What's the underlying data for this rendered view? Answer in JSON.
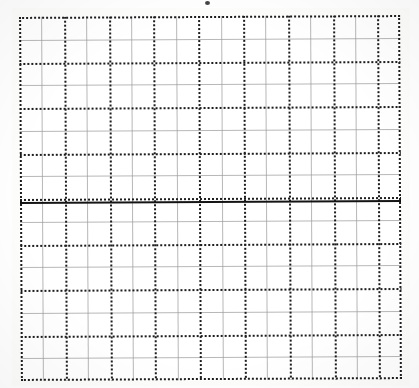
{
  "page": {
    "width": 419,
    "height": 388,
    "background_color": "#ffffff"
  },
  "artifact": {
    "name": "scan-speck",
    "label": ""
  },
  "chart_data": {
    "type": "table",
    "title": "",
    "subtitle": "",
    "xlabel": "",
    "ylabel": "",
    "annotations": [],
    "legend": [],
    "legend_position": "none",
    "grid": true,
    "plot_box": {
      "x": 20,
      "y": 16,
      "width": 381,
      "height": 364
    },
    "cell_size_px": 22.4,
    "columns": 17,
    "rows": 16,
    "xlim": [
      0,
      17
    ],
    "ylim": [
      0,
      16
    ],
    "x_ticks": [
      0,
      1,
      2,
      3,
      4,
      5,
      6,
      7,
      8,
      9,
      10,
      11,
      12,
      13,
      14,
      15,
      16,
      17
    ],
    "y_ticks": [
      0,
      1,
      2,
      3,
      4,
      5,
      6,
      7,
      8,
      9,
      10,
      11,
      12,
      13,
      14,
      15,
      16
    ],
    "x_tick_labels": [],
    "y_tick_labels": [],
    "series": [],
    "values": [],
    "categories": [],
    "axis": {
      "horizontal_axis_row": 8,
      "horizontal_axis_y_px": 185,
      "style": "solid-heavy",
      "color": "#141414"
    },
    "line_styles": {
      "minor": {
        "style": "solid",
        "color": "#9b9b9b",
        "width_px": 1
      },
      "major": {
        "style": "dotted",
        "color": "#1c1c1c",
        "width_px": 2
      },
      "border": {
        "style": "dotted",
        "color": "#1c1c1c",
        "width_px": 2
      }
    },
    "major_every_n_cells": 2
  }
}
